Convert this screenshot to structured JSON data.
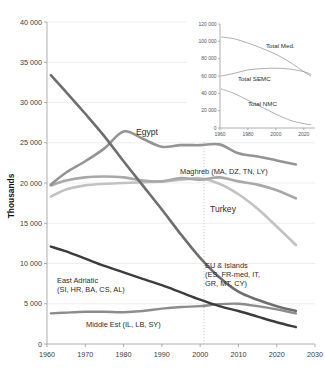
{
  "chart_data": [
    {
      "id": "main",
      "type": "line",
      "title": "",
      "xlabel": "",
      "ylabel": "Thousands",
      "xlim": [
        1960,
        2030
      ],
      "ylim": [
        0,
        40000
      ],
      "xticks": [
        1960,
        1970,
        1980,
        1990,
        2000,
        2010,
        2020,
        2030
      ],
      "xtick_labels": [
        "1960",
        "1970",
        "1980",
        "1990",
        "2000",
        "2010",
        "2020",
        "2030"
      ],
      "yticks": [
        0,
        5000,
        10000,
        15000,
        20000,
        25000,
        30000,
        35000,
        40000
      ],
      "ytick_labels": [
        "0",
        "5 000",
        "10 000",
        "15 000",
        "20 000",
        "25 000",
        "30 000",
        "35 000",
        "40 000"
      ],
      "grid": true,
      "legend_position": "inline-annotations",
      "annotations": [
        {
          "name": "reference-line-2001",
          "type": "vline",
          "x": 2001,
          "style": "dotted"
        }
      ],
      "series": [
        {
          "name": "EU & Islands (ES, FR-med, IT, GR, MT, CY)",
          "label": "EU & Islands",
          "label_lines": [
            "EU & Islands",
            "(ES, FR-med, IT,",
            "GR, MT, CY)"
          ],
          "color": "#6e6e6e",
          "width": 2.6,
          "x": [
            1961,
            1965,
            1970,
            1975,
            1980,
            1985,
            1990,
            1995,
            2000,
            2005,
            2010,
            2015,
            2020,
            2025
          ],
          "values": [
            33400,
            31300,
            28600,
            25800,
            22700,
            19700,
            16700,
            13600,
            10700,
            8300,
            6500,
            5500,
            4700,
            4100
          ]
        },
        {
          "name": "Egypt",
          "label": "Egypt",
          "color": "#949494",
          "width": 2.6,
          "x": [
            1961,
            1965,
            1970,
            1975,
            1980,
            1985,
            1990,
            1995,
            2000,
            2005,
            2010,
            2015,
            2020,
            2025
          ],
          "values": [
            19800,
            21300,
            22700,
            24300,
            26400,
            25500,
            24500,
            24700,
            24700,
            24800,
            23700,
            23300,
            22800,
            22300
          ]
        },
        {
          "name": "Maghreb (MA, DZ, TN, LY)",
          "label": "Maghreb (MA, DZ, TN, LY)",
          "color": "#a8a8a8",
          "width": 2.6,
          "x": [
            1961,
            1965,
            1970,
            1975,
            1980,
            1985,
            1990,
            1995,
            2000,
            2005,
            2010,
            2015,
            2020,
            2025
          ],
          "values": [
            19700,
            20300,
            20700,
            20800,
            20700,
            20300,
            20200,
            20600,
            20400,
            20700,
            20200,
            19800,
            19100,
            18100
          ]
        },
        {
          "name": "Turkey",
          "label": "Turkey",
          "color": "#c2c2c2",
          "width": 2.6,
          "x": [
            1961,
            1965,
            1970,
            1975,
            1980,
            1985,
            1990,
            1995,
            2000,
            2005,
            2010,
            2015,
            2020,
            2025
          ],
          "values": [
            18300,
            19200,
            19700,
            19900,
            20000,
            20100,
            20200,
            20400,
            20600,
            19900,
            18600,
            16800,
            14600,
            12300
          ]
        },
        {
          "name": "East Adriatic (SI, HR, BA, CS, AL)",
          "label": "East Adriatic",
          "label_lines": [
            "East Adriatic",
            "(SI, HR, BA, CS, AL)"
          ],
          "color": "#3c3c3c",
          "width": 2.4,
          "x": [
            1961,
            1965,
            1970,
            1975,
            1980,
            1985,
            1990,
            1995,
            2000,
            2005,
            2010,
            2015,
            2020,
            2025
          ],
          "values": [
            12100,
            11500,
            10600,
            9700,
            8900,
            8100,
            7300,
            6400,
            5500,
            4700,
            4100,
            3400,
            2700,
            2100
          ]
        },
        {
          "name": "Middle Est (IL, LB, SY)",
          "label": "Middle Est (IL, LB, SY)",
          "color": "#8c8c8c",
          "width": 2.4,
          "x": [
            1961,
            1965,
            1970,
            1975,
            1980,
            1985,
            1990,
            1995,
            2000,
            2005,
            2010,
            2015,
            2020,
            2025
          ],
          "values": [
            3800,
            3900,
            4000,
            4000,
            3950,
            4100,
            4400,
            4600,
            4700,
            4950,
            5000,
            4700,
            4300,
            3800
          ]
        }
      ]
    },
    {
      "id": "inset",
      "type": "line",
      "title": "",
      "xlabel": "",
      "ylabel": "",
      "xlim": [
        1960,
        2028
      ],
      "ylim": [
        0,
        120000
      ],
      "xticks": [
        1960,
        1980,
        2000,
        2020
      ],
      "xtick_labels": [
        "1960",
        "1980",
        "2000",
        "2020"
      ],
      "yticks": [
        0,
        20000,
        40000,
        60000,
        80000,
        100000,
        120000
      ],
      "ytick_labels": [
        "0",
        "20 000",
        "40 000",
        "60 000",
        "80 000",
        "100 000",
        "120 000"
      ],
      "grid": false,
      "legend_position": "inline-annotations",
      "series": [
        {
          "name": "Total Med.",
          "label": "Total Med.",
          "color": "#8e8e8e",
          "width": 0.7,
          "x": [
            1961,
            1970,
            1980,
            1990,
            2000,
            2010,
            2020,
            2025
          ],
          "values": [
            105000,
            103000,
            98000,
            92000,
            85000,
            76000,
            65000,
            60000
          ]
        },
        {
          "name": "Total SEMC",
          "label": "Total SEMC",
          "color": "#8e8e8e",
          "width": 0.7,
          "x": [
            1961,
            1970,
            1980,
            1990,
            2000,
            2010,
            2020,
            2025
          ],
          "values": [
            60000,
            63000,
            67000,
            68500,
            69000,
            68000,
            65000,
            62000
          ]
        },
        {
          "name": "Total NMC",
          "label": "Total NMC",
          "color": "#8e8e8e",
          "width": 0.7,
          "x": [
            1961,
            1970,
            1980,
            1990,
            2000,
            2010,
            2020,
            2025
          ],
          "values": [
            45000,
            40000,
            32000,
            24000,
            16000,
            9000,
            5000,
            4000
          ]
        }
      ]
    }
  ]
}
